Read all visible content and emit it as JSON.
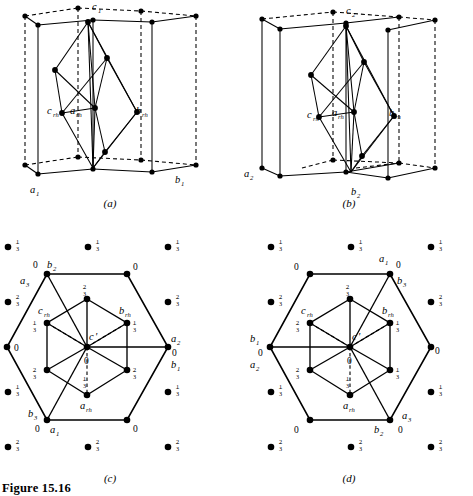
{
  "figure": {
    "caption": "Figure 15.16",
    "panels": [
      {
        "id": "a",
        "label": "(a)"
      },
      {
        "id": "b",
        "label": "(b)"
      },
      {
        "id": "c",
        "label": "(c)"
      },
      {
        "id": "d",
        "label": "(d)"
      }
    ]
  },
  "panel_a": {
    "axis_labels": [
      {
        "base": "c",
        "sub": "1"
      },
      {
        "base": "a",
        "sub": "1"
      },
      {
        "base": "b",
        "sub": "1"
      },
      {
        "base": "a",
        "sub": "rh"
      },
      {
        "base": "b",
        "sub": "rh"
      },
      {
        "base": "c",
        "sub": "rh"
      }
    ]
  },
  "panel_b": {
    "axis_labels": [
      {
        "base": "c",
        "sub": "2"
      },
      {
        "base": "a",
        "sub": "2"
      },
      {
        "base": "b",
        "sub": "2"
      },
      {
        "base": "a",
        "sub": "rh"
      },
      {
        "base": "b",
        "sub": "rh"
      },
      {
        "base": "c",
        "sub": "rh"
      }
    ]
  },
  "panel_c": {
    "outer_vertex_labels": [
      {
        "base": "b",
        "sub": "2",
        "height": "0"
      },
      {
        "base": "a",
        "sub": "3",
        "height": "0"
      },
      {
        "base": "b",
        "sub": "3",
        "height": "0"
      },
      {
        "base": "a",
        "sub": "1",
        "height": "0"
      },
      {
        "base": "a",
        "sub": "2",
        "height": "0"
      },
      {
        "base": "b",
        "sub": "1",
        "height": "0"
      }
    ],
    "inner_vertex_labels": [
      {
        "base": "c",
        "sub": "rh",
        "height": "1/3"
      },
      {
        "base": "b",
        "sub": "rh",
        "height": "1/3"
      },
      {
        "base": "a",
        "sub": "rh",
        "height": "1/3"
      },
      {
        "base": "c",
        "sub": "'",
        "height": "0"
      }
    ],
    "lattice_fractions": [
      "1/3",
      "2/3",
      "0"
    ],
    "outer_heights": [
      "0",
      "0",
      "0",
      "0",
      "0",
      "0"
    ],
    "inner_heights": [
      "2/3",
      "1/3",
      "1/3",
      "2/3",
      "2/3",
      "1/3"
    ],
    "centre_height": "0",
    "surround_dots": [
      {
        "col": 0,
        "row": 0,
        "frac": "1/3"
      },
      {
        "col": 1,
        "row": 0,
        "frac": "1/3"
      },
      {
        "col": 2,
        "row": 0,
        "frac": "1/3"
      },
      {
        "col": 0,
        "row": 1,
        "frac": "2/3"
      },
      {
        "col": 2,
        "row": 1,
        "frac": "2/3"
      },
      {
        "col": 0,
        "row": 2,
        "frac": "1/3"
      },
      {
        "col": 2,
        "row": 2,
        "frac": "1/3"
      },
      {
        "col": 0,
        "row": 3,
        "frac": "2/3"
      },
      {
        "col": 1,
        "row": 3,
        "frac": "2/3"
      },
      {
        "col": 2,
        "row": 3,
        "frac": "2/3"
      }
    ]
  },
  "panel_d": {
    "outer_vertex_labels": [
      {
        "base": "a",
        "sub": "1",
        "height": "0"
      },
      {
        "base": "b",
        "sub": "3",
        "height": "0"
      },
      {
        "base": "b",
        "sub": "1",
        "height": "0"
      },
      {
        "base": "a",
        "sub": "2",
        "height": "0"
      },
      {
        "base": "b",
        "sub": "2",
        "height": "0"
      },
      {
        "base": "a",
        "sub": "3",
        "height": "0"
      }
    ],
    "inner_vertex_labels": [
      {
        "base": "c",
        "sub": "rh",
        "height": "1/3"
      },
      {
        "base": "b",
        "sub": "rh",
        "height": "1/3"
      },
      {
        "base": "a",
        "sub": "rh",
        "height": "1/3"
      },
      {
        "base": "c",
        "sub": "'",
        "height": "0"
      }
    ],
    "outer_heights": [
      "0",
      "0",
      "0",
      "0",
      "0",
      "0"
    ],
    "inner_heights": [
      "2/3",
      "1/3",
      "2/3",
      "2/3",
      "1/3",
      "1/3"
    ],
    "centre_height": "0",
    "surround_dots": [
      {
        "col": 0,
        "row": 0,
        "frac": "1/3"
      },
      {
        "col": 1,
        "row": 0,
        "frac": "1/3"
      },
      {
        "col": 2,
        "row": 0,
        "frac": "1/3"
      },
      {
        "col": 0,
        "row": 1,
        "frac": "2/3"
      },
      {
        "col": 2,
        "row": 1,
        "frac": "2/3"
      },
      {
        "col": 0,
        "row": 2,
        "frac": "1/3"
      },
      {
        "col": 2,
        "row": 2,
        "frac": "1/3"
      },
      {
        "col": 0,
        "row": 3,
        "frac": "2/3"
      },
      {
        "col": 1,
        "row": 3,
        "frac": "2/3"
      },
      {
        "col": 2,
        "row": 3,
        "frac": "2/3"
      }
    ]
  },
  "colors": {
    "ink": "#000000",
    "background": "#ffffff"
  }
}
